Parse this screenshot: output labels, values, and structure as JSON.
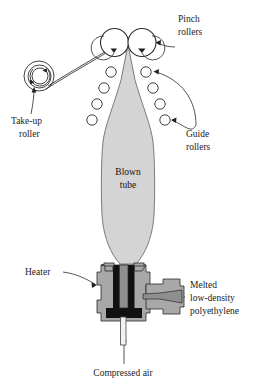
{
  "figure": {
    "type": "technical-diagram",
    "background_color": "#ffffff"
  },
  "labels": {
    "pinch_rollers": {
      "line1": "Pinch",
      "line2": "rollers"
    },
    "take_up_roller": {
      "line1": "Take-up",
      "line2": "roller"
    },
    "guide_rollers": {
      "line1": "Guide",
      "line2": "rollers"
    },
    "blown_tube": {
      "line1": "Blown",
      "line2": "tube"
    },
    "heater": {
      "line1": "Heater"
    },
    "melted_polyethylene": {
      "line1": "Melted",
      "line2": "low-density",
      "line3": "polyethylene"
    },
    "compressed_air": {
      "line1": "Compressed air"
    }
  },
  "colors": {
    "tube_fill": "#d4d4d4",
    "tube_stroke": "#6e6e6e",
    "die_metal": "#a8a8a8",
    "die_dark": "#111111",
    "die_mid": "#8f8f8f",
    "line": "#2a2a2a",
    "text": "#1a1a1a"
  },
  "components": {
    "pinch_roller_count": 2,
    "guide_roller_count_left": 4,
    "guide_roller_count_right": 4,
    "take_up_roller_count": 1
  }
}
